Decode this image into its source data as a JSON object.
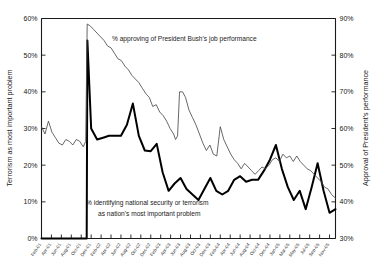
{
  "chart_data": {
    "type": "line",
    "title": "",
    "xlabel": "",
    "grid": false,
    "legend_position": "inline-annotations",
    "axes": {
      "left": {
        "label": "Terrorism as most important problem",
        "ticks": [
          "0%",
          "10%",
          "20%",
          "30%",
          "40%",
          "50%",
          "60%"
        ],
        "tick_values": [
          0,
          10,
          20,
          30,
          40,
          50,
          60
        ],
        "ylim": [
          0,
          60
        ]
      },
      "right": {
        "label": "Approval of President's performance",
        "ticks": [
          "30%",
          "40%",
          "50%",
          "60%",
          "70%",
          "80%",
          "90%"
        ],
        "tick_values": [
          30,
          40,
          50,
          60,
          70,
          80,
          90
        ],
        "ylim": [
          30,
          90
        ]
      }
    },
    "annotations": [
      {
        "name": "approval-annotation",
        "text": "% approving of President Bush's job performance"
      },
      {
        "name": "terrorism-annotation-line1",
        "text": "% identifying national security or terrorism"
      },
      {
        "name": "terrorism-annotation-line2",
        "text": "as nation's most important problem"
      }
    ],
    "categories": [
      "Feb-01",
      "Apr-01",
      "Jun-01",
      "Aug-01",
      "Oct-01",
      "Dec-01",
      "Feb-02",
      "Apr-02",
      "Jun-02",
      "Aug-02",
      "Oct-02",
      "Dec-02",
      "Feb-03",
      "Apr-03",
      "Jun-03",
      "Aug-03",
      "Oct-03",
      "Dec-03",
      "Feb-04",
      "Apr-04",
      "Jun-04",
      "Aug-04",
      "Oct-04",
      "Dec-04",
      "Jan-05",
      "Mar-05",
      "May-05",
      "Jul-05",
      "Sep-05",
      "Nov-05"
    ],
    "series": [
      {
        "name": "% identifying national security or terrorism as nation's most important problem",
        "axis": "left",
        "style": "thick",
        "color": "#000000",
        "x": [
          0.0,
          1.0,
          2.0,
          3.0,
          4.0,
          4.55,
          4.62,
          5.0,
          5.6,
          6.2,
          6.8,
          7.4,
          8.0,
          8.6,
          9.2,
          9.8,
          10.4,
          11.0,
          11.6,
          12.2,
          12.8,
          13.4,
          14.0,
          14.6,
          15.2,
          15.8,
          16.4,
          17.0,
          17.6,
          18.2,
          18.8,
          19.4,
          20.0,
          20.6,
          21.2,
          21.8,
          22.4,
          23.0,
          23.6,
          24.2,
          24.8,
          25.4,
          26.0,
          26.6,
          27.2,
          27.8,
          28.4,
          29.0,
          29.6
        ],
        "values": [
          0,
          0,
          0,
          0,
          0,
          0,
          54.0,
          30.0,
          27.0,
          27.5,
          28.0,
          28.0,
          28.0,
          31.0,
          36.8,
          28.0,
          24.0,
          23.8,
          25.8,
          18.0,
          13.0,
          15.0,
          16.5,
          13.5,
          12.0,
          10.5,
          13.5,
          16.5,
          13.0,
          12.0,
          13.0,
          16.0,
          17.0,
          15.5,
          16.0,
          16.0,
          18.5,
          21.5,
          25.5,
          19.0,
          14.0,
          10.5,
          13.0,
          8.0,
          14.0,
          20.5,
          13.0,
          7.0,
          8.0
        ]
      },
      {
        "name": "% approving of President Bush's job performance",
        "axis": "right",
        "style": "thin",
        "color": "#4d4d4d",
        "x": [
          0.0,
          0.35,
          0.7,
          1.05,
          1.4,
          1.75,
          2.1,
          2.45,
          2.8,
          3.15,
          3.5,
          3.85,
          4.2,
          4.45,
          4.6,
          4.9,
          5.25,
          5.6,
          5.95,
          6.3,
          6.65,
          7.0,
          7.35,
          7.7,
          8.05,
          8.4,
          8.75,
          9.1,
          9.45,
          9.8,
          10.15,
          10.5,
          10.85,
          11.2,
          11.55,
          11.9,
          12.25,
          12.6,
          12.95,
          13.3,
          13.5,
          13.7,
          13.9,
          14.2,
          14.5,
          14.85,
          15.2,
          15.55,
          15.9,
          16.25,
          16.6,
          16.95,
          17.3,
          17.65,
          18.0,
          18.35,
          18.7,
          19.05,
          19.4,
          19.75,
          20.1,
          20.45,
          20.8,
          21.15,
          21.5,
          21.85,
          22.2,
          22.55,
          22.9,
          23.25,
          23.6,
          23.95,
          24.3,
          24.65,
          25.0,
          25.35,
          25.7,
          26.05,
          26.4,
          26.75,
          27.1,
          27.45,
          27.8,
          28.15,
          28.5,
          28.85,
          29.2,
          29.6
        ],
        "values": [
          60.5,
          58.5,
          62.0,
          59.0,
          57.5,
          56.0,
          55.5,
          57.0,
          56.5,
          55.5,
          57.0,
          56.5,
          55.0,
          56.5,
          88.5,
          88.0,
          87.0,
          86.0,
          85.0,
          84.0,
          82.5,
          82.0,
          80.5,
          79.0,
          78.5,
          77.0,
          76.0,
          74.5,
          73.5,
          72.5,
          71.0,
          69.5,
          68.5,
          66.0,
          66.5,
          64.5,
          63.5,
          62.0,
          60.0,
          58.5,
          57.0,
          58.0,
          70.0,
          70.0,
          68.5,
          65.0,
          63.0,
          61.0,
          58.5,
          56.0,
          54.0,
          55.5,
          53.0,
          52.5,
          60.5,
          57.0,
          55.0,
          53.0,
          51.5,
          50.5,
          49.0,
          50.5,
          49.5,
          48.5,
          47.5,
          48.5,
          49.5,
          49.0,
          50.0,
          51.5,
          52.0,
          51.0,
          53.0,
          52.0,
          52.5,
          51.0,
          52.5,
          51.0,
          50.0,
          49.0,
          48.5,
          47.5,
          46.5,
          45.5,
          44.0,
          43.5,
          42.0,
          41.0
        ]
      }
    ]
  }
}
